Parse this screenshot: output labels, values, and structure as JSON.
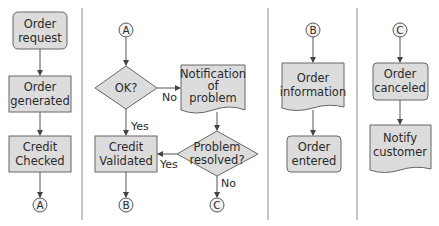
{
  "columns": [
    {
      "nodes": [
        {
          "id": "order-request",
          "shape": "rounded-rect",
          "lines": [
            "Order",
            "request"
          ]
        },
        {
          "id": "order-generated",
          "shape": "rect",
          "lines": [
            "Order",
            "generated"
          ]
        },
        {
          "id": "credit-checked",
          "shape": "rect",
          "lines": [
            "Credit",
            "Checked"
          ]
        },
        {
          "id": "connector-a-out",
          "shape": "circle",
          "label": "A"
        }
      ]
    },
    {
      "nodes": [
        {
          "id": "connector-a-in",
          "shape": "circle",
          "label": "A"
        },
        {
          "id": "ok-decision",
          "shape": "diamond",
          "label": "OK?"
        },
        {
          "id": "notification-of-problem",
          "shape": "document",
          "lines": [
            "Notification",
            "of",
            "problem"
          ]
        },
        {
          "id": "problem-resolved",
          "shape": "diamond",
          "lines": [
            "Problem",
            "resolved?"
          ]
        },
        {
          "id": "credit-validated",
          "shape": "rect",
          "lines": [
            "Credit",
            "Validated"
          ]
        },
        {
          "id": "connector-b-out",
          "shape": "circle",
          "label": "B"
        },
        {
          "id": "connector-c-out",
          "shape": "circle",
          "label": "C"
        }
      ],
      "edge_labels": {
        "ok_no": "No",
        "ok_yes": "Yes",
        "resolved_yes": "Yes",
        "resolved_no": "No"
      }
    },
    {
      "nodes": [
        {
          "id": "connector-b-in",
          "shape": "circle",
          "label": "B"
        },
        {
          "id": "order-information",
          "shape": "document",
          "lines": [
            "Order",
            "information"
          ]
        },
        {
          "id": "order-entered",
          "shape": "rounded-rect",
          "lines": [
            "Order",
            "entered"
          ]
        }
      ]
    },
    {
      "nodes": [
        {
          "id": "connector-c-in",
          "shape": "circle",
          "label": "C"
        },
        {
          "id": "order-canceled",
          "shape": "rounded-rect",
          "lines": [
            "Order",
            "canceled"
          ]
        },
        {
          "id": "notify-customer",
          "shape": "document",
          "lines": [
            "Notify",
            "customer"
          ]
        }
      ]
    }
  ],
  "colors": {
    "fill": "#dcdcdc",
    "stroke": "#555555",
    "divider": "#8a8a8a"
  }
}
